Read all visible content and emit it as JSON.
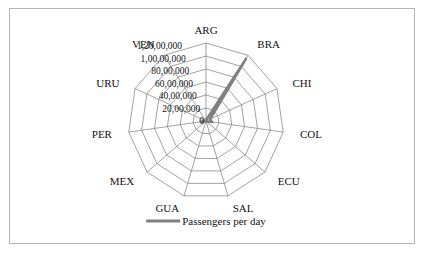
{
  "figure": {
    "border_color": "#b7b7b7",
    "background": "#ffffff"
  },
  "legend": {
    "label": "Passengers per day",
    "swatch_color": "#808080",
    "position": "bottom-center"
  },
  "chart_data": {
    "type": "radar",
    "title": "",
    "xlabel": "",
    "ylabel": "",
    "grid": true,
    "legend_position": "bottom",
    "categories": [
      "ARG",
      "BRA",
      "CHI",
      "COL",
      "ECU",
      "SAL",
      "GUA",
      "MEX",
      "PER",
      "URU",
      "VEN"
    ],
    "rmin": 0,
    "rmax": 12000000,
    "rticks": [
      0,
      2000000,
      4000000,
      6000000,
      8000000,
      10000000,
      12000000
    ],
    "rtick_labels": [
      "0",
      "20,00,000",
      "40,00,000",
      "60,00,000",
      "80,00,000",
      "1,00,00,000",
      "1,20,00,000"
    ],
    "series": [
      {
        "name": "Passengers per day",
        "color": "#808080",
        "values": [
          120000,
          11500000,
          700000,
          900000,
          150000,
          90000,
          80000,
          130000,
          850000,
          110000,
          120000
        ]
      }
    ]
  }
}
